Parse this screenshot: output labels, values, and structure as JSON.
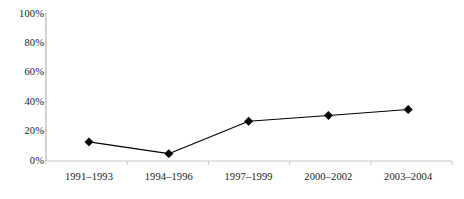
{
  "chart_data": {
    "type": "line",
    "title": "",
    "subtitle": "",
    "xlabel": "",
    "ylabel": "",
    "categories": [
      "1991–1993",
      "1994–1996",
      "1997–1999",
      "2000–2002",
      "2003–2004"
    ],
    "values": [
      13,
      5,
      27,
      31,
      35
    ],
    "value_labels": [
      "13%",
      "5%",
      "27%",
      "31%",
      "35%"
    ],
    "series": [
      {
        "name": "",
        "values": [
          13,
          5,
          27,
          31,
          35
        ],
        "marker": "diamond",
        "marker_color": "#000000",
        "line_color": "#000000"
      }
    ],
    "ylim": [
      0,
      100
    ],
    "ytick_values": [
      0,
      20,
      40,
      60,
      80,
      100
    ],
    "ytick_labels": [
      "0%",
      "20%",
      "40%",
      "60%",
      "80%",
      "100%"
    ],
    "grid": false,
    "legend": false,
    "legend_position": "none",
    "annotations": []
  },
  "axes": {
    "y_axis_color": "#c9c9c9",
    "x_axis_color": "#c9c9c9",
    "tick_color": "#c9c9c9",
    "label_color": "#1a1a1a"
  },
  "canvas": {
    "background": "#ffffff",
    "width": 464,
    "height": 199
  }
}
